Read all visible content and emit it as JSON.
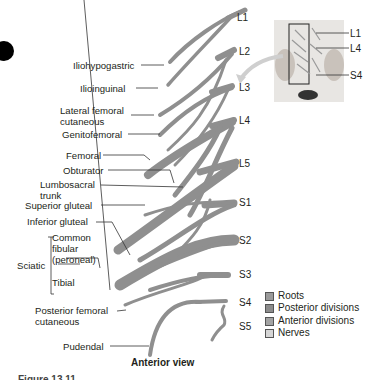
{
  "figure": {
    "title_view": "Anterior view",
    "caption_partial": "Figure 13.11",
    "root_labels": [
      "L1",
      "L2",
      "L3",
      "L4",
      "L5",
      "S1",
      "S2",
      "S3",
      "S4",
      "S5"
    ],
    "nerve_labels": {
      "iliohypogastric": "Iliohypogastric",
      "ilioinguinal": "Ilioinguinal",
      "lateral_femoral_cutaneous_1": "Lateral femoral",
      "lateral_femoral_cutaneous_2": "cutaneous",
      "genitofemoral": "Genitofemoral",
      "femoral": "Femoral",
      "obturator": "Obturator",
      "lumbosacral_trunk_1": "Lumbosacral",
      "lumbosacral_trunk_2": "trunk",
      "superior_gluteal": "Superior gluteal",
      "inferior_gluteal": "Inferior gluteal",
      "sciatic": "Sciatic",
      "common_fibular_1": "Common",
      "common_fibular_2": "fibular",
      "common_fibular_3": "(peroneal)",
      "tibial": "Tibial",
      "posterior_femoral_cutaneous_1": "Posterior femoral",
      "posterior_femoral_cutaneous_2": "cutaneous",
      "pudendal": "Pudendal"
    },
    "inset": {
      "labels": [
        "L1",
        "L4",
        "S4"
      ]
    },
    "legend": [
      {
        "label": "Roots",
        "color": "#9a9a9a"
      },
      {
        "label": "Posterior divisions",
        "color": "#8c8c8c"
      },
      {
        "label": "Anterior divisions",
        "color": "#a3a3a3"
      },
      {
        "label": "Nerves",
        "color": "#d6d6d6"
      }
    ]
  }
}
